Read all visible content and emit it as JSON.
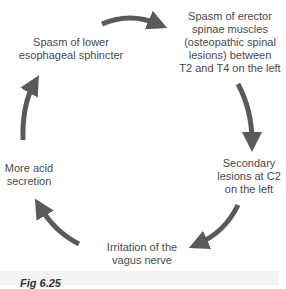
{
  "diagram": {
    "type": "cycle",
    "arrow_color": "#5a5a5a",
    "nodes": [
      {
        "id": "n1",
        "lines": [
          "Spasm of erector",
          "spinae muscles",
          "(osteopathic spinal",
          "lesions) between",
          "T2 and T4 on the left"
        ]
      },
      {
        "id": "n2",
        "lines": [
          "Secondary",
          "lesions at C2",
          "on the left"
        ]
      },
      {
        "id": "n3",
        "lines": [
          "Irritation of the",
          "vagus nerve"
        ]
      },
      {
        "id": "n4",
        "lines": [
          "More acid",
          "secretion"
        ]
      },
      {
        "id": "n5",
        "lines": [
          "Spasm of lower",
          "esophageal sphincter"
        ]
      }
    ],
    "edges": [
      {
        "from": "n5",
        "to": "n1"
      },
      {
        "from": "n1",
        "to": "n2"
      },
      {
        "from": "n2",
        "to": "n3"
      },
      {
        "from": "n3",
        "to": "n4"
      },
      {
        "from": "n4",
        "to": "n5"
      }
    ]
  },
  "caption": {
    "label": "Fig 6.25"
  }
}
